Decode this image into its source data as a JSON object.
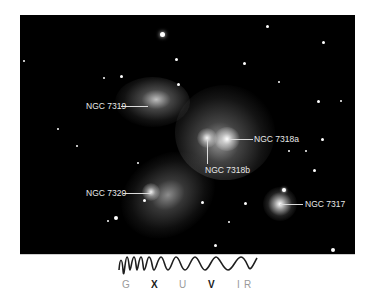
{
  "image": {
    "subject": "Stephan's Quintet galaxy group",
    "background": "#000000"
  },
  "labels": [
    {
      "id": "ngc7319",
      "text": "NGC 7319"
    },
    {
      "id": "ngc7318a",
      "text": "NGC 7318a"
    },
    {
      "id": "ngc7318b",
      "text": "NGC 7318b"
    },
    {
      "id": "ngc7320",
      "text": "NGC 7320"
    },
    {
      "id": "ngc7317",
      "text": "NGC 7317"
    }
  ],
  "spectrum": {
    "bands": [
      {
        "letter": "G",
        "highlighted": false
      },
      {
        "letter": "X",
        "highlighted": true
      },
      {
        "letter": "U",
        "highlighted": false
      },
      {
        "letter": "V",
        "highlighted": true
      },
      {
        "letter": "I",
        "highlighted": false
      },
      {
        "letter": "R",
        "highlighted": false
      }
    ]
  }
}
